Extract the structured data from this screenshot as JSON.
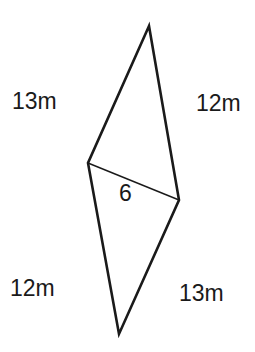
{
  "diagram": {
    "type": "kite / two triangles sharing a diagonal",
    "stroke_color": "#1a1a1a",
    "background": "#ffffff",
    "vertices": {
      "top": [
        149,
        26
      ],
      "left": [
        88,
        163
      ],
      "right": [
        179,
        200
      ],
      "bottom": [
        119,
        334
      ]
    },
    "labels": {
      "top_left_side": "13m",
      "top_right_side": "12m",
      "diagonal": "6",
      "bottom_left_side": "12m",
      "bottom_right_side": "13m"
    }
  }
}
